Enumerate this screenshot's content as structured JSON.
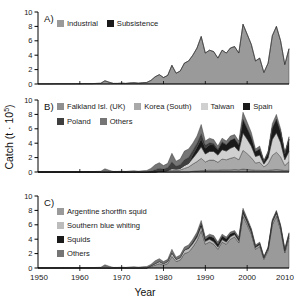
{
  "y_axis": {
    "label_prefix": "Catch (t · 10",
    "label_sup": "5",
    "label_suffix": ")",
    "max": 10,
    "ticks": [
      0,
      2,
      4,
      6,
      8,
      10
    ]
  },
  "x_axis": {
    "label": "Year",
    "min": 1950,
    "max": 2010,
    "ticks": [
      1950,
      1960,
      1970,
      1980,
      1990,
      2000,
      2010
    ]
  },
  "chart_data": [
    {
      "id": "A",
      "label": "A)",
      "type": "area",
      "stacked": true,
      "x_start": 1950,
      "x_step": 1,
      "ylim": [
        0,
        10
      ],
      "grid": false,
      "legend_rows": [
        2
      ],
      "series": [
        {
          "name": "Industrial",
          "color": "#9a9a9a",
          "values": [
            0.02,
            0.02,
            0.02,
            0.02,
            0.03,
            0.03,
            0.03,
            0.03,
            0.03,
            0.04,
            0.04,
            0.05,
            0.05,
            0.05,
            0.08,
            0.1,
            0.45,
            0.25,
            0.08,
            0.08,
            0.12,
            0.08,
            0.15,
            0.18,
            0.12,
            0.18,
            0.22,
            0.5,
            1,
            1.3,
            0.9,
            1.2,
            2.6,
            1.5,
            1.8,
            2.9,
            3.2,
            4,
            5,
            6.6,
            4.3,
            4.7,
            4.5,
            3.6,
            4.7,
            4.3,
            5,
            5.2,
            4.3,
            8.3,
            6.9,
            5.5,
            3.2,
            3.6,
            1.6,
            2.9,
            6.7,
            8,
            6,
            2.7,
            4.9
          ]
        },
        {
          "name": "Subsistence",
          "color": "#1a1a1a",
          "values": [
            0,
            0,
            0,
            0,
            0,
            0,
            0,
            0,
            0,
            0,
            0,
            0,
            0,
            0,
            0,
            0,
            0,
            0,
            0,
            0,
            0,
            0,
            0,
            0,
            0,
            0,
            0,
            0,
            0,
            0,
            0,
            0,
            0,
            0,
            0,
            0,
            0,
            0,
            0,
            0,
            0,
            0,
            0,
            0,
            0,
            0,
            0,
            0,
            0,
            0,
            0,
            0,
            0,
            0,
            0,
            0,
            0,
            0,
            0,
            0,
            0
          ]
        }
      ]
    },
    {
      "id": "B",
      "label": "B)",
      "type": "area",
      "stacked": true,
      "x_start": 1950,
      "x_step": 1,
      "ylim": [
        0,
        10
      ],
      "grid": false,
      "legend_rows": [
        4,
        2
      ],
      "series": [
        {
          "name": "Falkland Isl. (UK)",
          "color": "#8f8f8f",
          "values": [
            0,
            0,
            0,
            0,
            0,
            0,
            0,
            0,
            0,
            0,
            0,
            0,
            0,
            0,
            0,
            0,
            0,
            0,
            0,
            0,
            0,
            0,
            0,
            0,
            0,
            0,
            0,
            0,
            0,
            0,
            0,
            0,
            0,
            0,
            0,
            0,
            0,
            0.1,
            0.15,
            0.2,
            0.2,
            0.25,
            0.25,
            0.25,
            0.3,
            0.3,
            0.3,
            0.35,
            0.3,
            0.4,
            0.35,
            0.3,
            0.25,
            0.25,
            0.2,
            0.25,
            0.3,
            0.35,
            0.3,
            0.2,
            0.25
          ]
        },
        {
          "name": "Korea (South)",
          "color": "#a9a9a9",
          "values": [
            0,
            0,
            0,
            0,
            0,
            0,
            0,
            0,
            0,
            0,
            0,
            0,
            0,
            0,
            0,
            0,
            0,
            0,
            0,
            0,
            0,
            0,
            0,
            0,
            0,
            0,
            0,
            0,
            0,
            0.1,
            0.1,
            0.2,
            0.3,
            0.2,
            0.3,
            0.5,
            0.7,
            1,
            1.3,
            1.7,
            1.2,
            1.4,
            1.4,
            1.1,
            1.5,
            1.4,
            1.6,
            1.7,
            1.4,
            2.6,
            2.2,
            1.7,
            1,
            1.1,
            0.5,
            0.9,
            2,
            2.4,
            1.8,
            0.7,
            1.2
          ]
        },
        {
          "name": "Taiwan",
          "color": "#d0d0d0",
          "values": [
            0,
            0,
            0,
            0,
            0,
            0,
            0,
            0,
            0,
            0,
            0,
            0,
            0,
            0,
            0,
            0,
            0,
            0,
            0,
            0,
            0,
            0,
            0,
            0,
            0,
            0,
            0,
            0,
            0,
            0,
            0,
            0,
            0.2,
            0.2,
            0.2,
            0.4,
            0.5,
            0.8,
            1.2,
            1.6,
            1.1,
            1.2,
            1.2,
            1,
            1.3,
            1.2,
            1.4,
            1.5,
            1.2,
            2.4,
            2,
            1.6,
            0.9,
            1,
            0.4,
            0.8,
            2.2,
            2.7,
            2,
            0.8,
            1.4
          ]
        },
        {
          "name": "Spain",
          "color": "#1a1a1a",
          "values": [
            0,
            0,
            0,
            0,
            0,
            0,
            0,
            0,
            0,
            0,
            0,
            0,
            0,
            0,
            0,
            0,
            0,
            0,
            0,
            0,
            0,
            0,
            0,
            0,
            0,
            0,
            0,
            0,
            0,
            0,
            0,
            0,
            0,
            0,
            0,
            0,
            0,
            0.5,
            0.8,
            1.1,
            0.8,
            0.9,
            0.9,
            0.7,
            1,
            0.9,
            1.1,
            1.1,
            0.9,
            1.9,
            1.5,
            1.2,
            0.7,
            0.85,
            0.35,
            0.7,
            1.6,
            1.9,
            1.5,
            0.8,
            1.7
          ]
        },
        {
          "name": "Poland",
          "color": "#3f3f3f",
          "values": [
            0,
            0,
            0,
            0,
            0,
            0,
            0,
            0,
            0,
            0,
            0,
            0,
            0,
            0,
            0,
            0,
            0,
            0,
            0,
            0,
            0,
            0,
            0,
            0,
            0,
            0,
            0,
            0.1,
            0.3,
            0.4,
            0.3,
            0.4,
            0.9,
            0.4,
            0.5,
            0.8,
            0.8,
            0.6,
            0.55,
            0.7,
            0.4,
            0.3,
            0.2,
            0.1,
            0.1,
            0,
            0,
            0,
            0,
            0,
            0,
            0,
            0,
            0,
            0,
            0,
            0,
            0,
            0,
            0,
            0
          ]
        },
        {
          "name": "Others",
          "color": "#757575",
          "values": [
            0.02,
            0.02,
            0.02,
            0.02,
            0.03,
            0.03,
            0.03,
            0.03,
            0.03,
            0.04,
            0.04,
            0.05,
            0.05,
            0.05,
            0.08,
            0.1,
            0.45,
            0.25,
            0.08,
            0.08,
            0.12,
            0.08,
            0.15,
            0.18,
            0.12,
            0.18,
            0.22,
            0.4,
            0.7,
            0.8,
            0.5,
            0.6,
            1.2,
            0.7,
            0.8,
            1.2,
            1.2,
            1,
            1,
            1.3,
            0.6,
            0.65,
            0.55,
            0.45,
            0.5,
            0.5,
            0.6,
            0.55,
            0.5,
            1,
            0.85,
            0.7,
            0.35,
            0.4,
            0.15,
            0.25,
            0.6,
            0.65,
            0.4,
            0.2,
            0.35
          ]
        }
      ]
    },
    {
      "id": "C",
      "label": "C)",
      "type": "area",
      "stacked": true,
      "x_start": 1950,
      "x_step": 1,
      "ylim": [
        0,
        10
      ],
      "grid": false,
      "legend_rows": [
        1,
        1,
        1,
        1
      ],
      "series": [
        {
          "name": "Argentine shortfin squid",
          "color": "#9a9a9a",
          "values": [
            0,
            0,
            0,
            0,
            0,
            0,
            0,
            0,
            0,
            0,
            0,
            0,
            0,
            0,
            0,
            0,
            0,
            0,
            0,
            0,
            0,
            0,
            0,
            0,
            0,
            0,
            0,
            0.2,
            0.4,
            0.6,
            0.4,
            0.6,
            1.6,
            0.9,
            1.1,
            2,
            2.2,
            2.9,
            3.8,
            5.2,
            3.3,
            3.6,
            3.3,
            2.6,
            3.6,
            3.3,
            4,
            4.3,
            3.5,
            7.2,
            6,
            4.7,
            2.6,
            3,
            1.2,
            2.4,
            6,
            7.2,
            5.3,
            2.1,
            4.2
          ]
        },
        {
          "name": "Southern blue whiting",
          "color": "#bcbcbc",
          "values": [
            0,
            0,
            0,
            0,
            0,
            0,
            0,
            0,
            0,
            0,
            0,
            0,
            0,
            0,
            0,
            0,
            0,
            0,
            0,
            0,
            0,
            0,
            0,
            0,
            0,
            0,
            0,
            0.1,
            0.2,
            0.3,
            0.2,
            0.3,
            0.5,
            0.3,
            0.35,
            0.5,
            0.5,
            0.5,
            0.5,
            0.6,
            0.4,
            0.4,
            0.35,
            0.3,
            0.35,
            0.3,
            0.35,
            0.35,
            0.3,
            0.4,
            0.35,
            0.3,
            0.25,
            0.25,
            0.2,
            0.25,
            0.35,
            0.4,
            0.35,
            0.25,
            0.3
          ]
        },
        {
          "name": "Squids",
          "color": "#1a1a1a",
          "values": [
            0,
            0,
            0,
            0,
            0,
            0,
            0,
            0,
            0,
            0,
            0,
            0,
            0,
            0,
            0,
            0,
            0,
            0,
            0,
            0,
            0,
            0,
            0,
            0,
            0,
            0,
            0,
            0,
            0,
            0,
            0,
            0,
            0,
            0,
            0,
            0,
            0.1,
            0.2,
            0.3,
            0.4,
            0.3,
            0.4,
            0.55,
            0.45,
            0.5,
            0.45,
            0.4,
            0.3,
            0.25,
            0.4,
            0.3,
            0.3,
            0.2,
            0.2,
            0.1,
            0.15,
            0.2,
            0.25,
            0.2,
            0.2,
            0.25
          ]
        },
        {
          "name": "Others",
          "color": "#757575",
          "values": [
            0.02,
            0.02,
            0.02,
            0.02,
            0.03,
            0.03,
            0.03,
            0.03,
            0.03,
            0.04,
            0.04,
            0.05,
            0.05,
            0.05,
            0.08,
            0.1,
            0.45,
            0.25,
            0.08,
            0.08,
            0.12,
            0.08,
            0.15,
            0.18,
            0.12,
            0.18,
            0.22,
            0.2,
            0.4,
            0.4,
            0.3,
            0.3,
            0.5,
            0.3,
            0.35,
            0.4,
            0.4,
            0.4,
            0.4,
            0.4,
            0.3,
            0.3,
            0.3,
            0.25,
            0.25,
            0.25,
            0.25,
            0.25,
            0.25,
            0.3,
            0.25,
            0.2,
            0.15,
            0.15,
            0.1,
            0.1,
            0.15,
            0.15,
            0.15,
            0.15,
            0.15
          ]
        }
      ]
    }
  ]
}
